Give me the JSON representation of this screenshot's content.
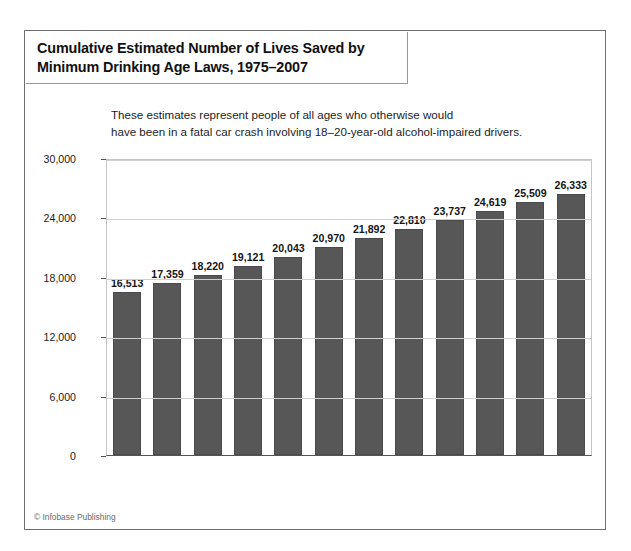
{
  "figure": {
    "title_line_1": "Cumulative Estimated Number of Lives Saved by",
    "title_line_2": "Minimum Drinking Age Laws, 1975–2007",
    "subtitle_line_1": "These estimates represent people of all ages who otherwise would",
    "subtitle_line_2": "have been in a fatal car crash involving 18–20-year-old alcohol-impaired drivers.",
    "credit": "© Infobase Publishing",
    "bar_color": "#575757",
    "grid_color": "#cfcfcf",
    "frame_color": "#6f6f6f"
  },
  "chart_data": {
    "type": "bar",
    "title": "Cumulative Estimated Number of Lives Saved by Minimum Drinking Age Laws, 1975–2007",
    "subtitle": "These estimates represent people of all ages who otherwise would have been in a fatal car crash involving 18–20-year-old alcohol-impaired drivers.",
    "xlabel": "Year",
    "ylabel": "",
    "ylim": [
      0,
      30000
    ],
    "yticks": [
      0,
      6000,
      12000,
      18000,
      24000,
      30000
    ],
    "ytick_labels": [
      "0",
      "6,000",
      "12,000",
      "18,000",
      "24,000",
      "30,000"
    ],
    "grid": true,
    "legend": false,
    "categories": [
      "1975–96",
      "1997",
      "1998",
      "1999",
      "2000",
      "2001",
      "2002",
      "2003",
      "2004",
      "2005",
      "2006",
      "2007"
    ],
    "values": [
      16513,
      17359,
      18220,
      19121,
      20043,
      20970,
      21892,
      22810,
      23737,
      24619,
      25509,
      26333
    ],
    "value_labels": [
      "16,513",
      "17,359",
      "18,220",
      "19,121",
      "20,043",
      "20,970",
      "21,892",
      "22,810",
      "23,737",
      "24,619",
      "25,509",
      "26,333"
    ]
  }
}
